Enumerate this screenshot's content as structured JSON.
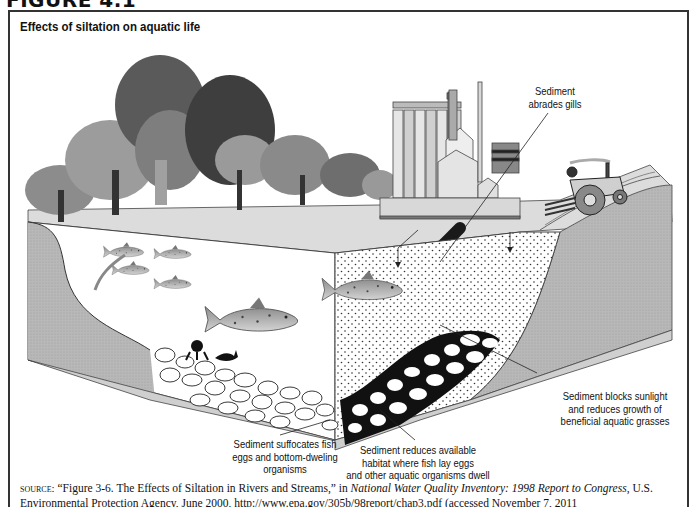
{
  "figure_header": "FIGURE 4.1",
  "title": "Effects of siltation on aquatic life",
  "labels": {
    "gills": [
      "Sediment",
      "abrades gills"
    ],
    "sunlight": [
      "Sediment blocks sunlight",
      "and reduces growth of",
      "beneficial aquatic grasses"
    ],
    "eggs": [
      "Sediment suffocates fish",
      "eggs and bottom-dweling",
      "organisms"
    ],
    "habitat": [
      "Sediment reduces available",
      "habitat where fish lay eggs",
      "and other aquatic organisms dwell"
    ]
  },
  "source": {
    "prefix": "source:",
    "part1": " “Figure 3-6. The Effects of Siltation in Rivers and Streams,” in ",
    "italic": "National Water Quality Inventory: 1998 Report to Congress",
    "part2": ", U.S. Environmental Protection Agency, June 2000, http://www.epa.gov/305b/98report/chap3.pdf (accessed November 7, 2011"
  },
  "scene": {
    "elements": [
      "trees-icon",
      "factory-icon",
      "drain-pipe-icon",
      "tractor-icon",
      "fish-icon",
      "gravel-bed",
      "sediment-dots"
    ],
    "colors": {
      "ground": "#d9d9d9",
      "bank": "#b5b5b5",
      "water": "#ffffff",
      "tree_dark": "#3a3a3a",
      "tree_mid": "#7a7a7a",
      "tree_light": "#a8a8a8",
      "gravel_dark": "#111111",
      "frame": "#333333"
    }
  }
}
